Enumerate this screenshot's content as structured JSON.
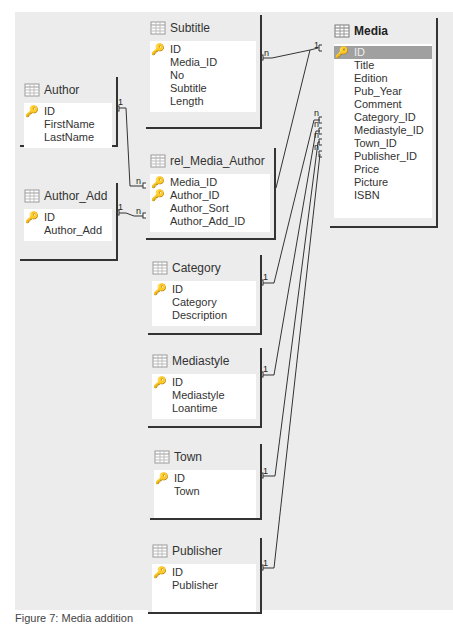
{
  "tables": [
    {
      "id": "subtitle",
      "name": "Subtitle",
      "fields": [
        {
          "name": "ID",
          "key": true
        },
        {
          "name": "Media_ID"
        },
        {
          "name": "No"
        },
        {
          "name": "Subtitle"
        },
        {
          "name": "Length"
        }
      ]
    },
    {
      "id": "author",
      "name": "Author",
      "fields": [
        {
          "name": "ID",
          "key": true
        },
        {
          "name": "FirstName"
        },
        {
          "name": "LastName"
        }
      ]
    },
    {
      "id": "rel_media_author",
      "name": "rel_Media_Author",
      "fields": [
        {
          "name": "Media_ID",
          "key": true
        },
        {
          "name": "Author_ID",
          "key": true
        },
        {
          "name": "Author_Sort"
        },
        {
          "name": "Author_Add_ID"
        }
      ]
    },
    {
      "id": "author_add",
      "name": "Author_Add",
      "fields": [
        {
          "name": "ID",
          "key": true
        },
        {
          "name": "Author_Add"
        }
      ]
    },
    {
      "id": "category",
      "name": "Category",
      "fields": [
        {
          "name": "ID",
          "key": true
        },
        {
          "name": "Category"
        },
        {
          "name": "Description"
        }
      ]
    },
    {
      "id": "mediastyle",
      "name": "Mediastyle",
      "fields": [
        {
          "name": "ID",
          "key": true
        },
        {
          "name": "Mediastyle"
        },
        {
          "name": "Loantime"
        }
      ]
    },
    {
      "id": "town",
      "name": "Town",
      "fields": [
        {
          "name": "ID",
          "key": true
        },
        {
          "name": "Town"
        }
      ]
    },
    {
      "id": "publisher",
      "name": "Publisher",
      "fields": [
        {
          "name": "ID",
          "key": true
        },
        {
          "name": "Publisher"
        }
      ]
    },
    {
      "id": "media",
      "name": "Media",
      "fields": [
        {
          "name": "ID",
          "key": true,
          "selected": true
        },
        {
          "name": "Title"
        },
        {
          "name": "Edition"
        },
        {
          "name": "Pub_Year"
        },
        {
          "name": "Comment"
        },
        {
          "name": "Category_ID"
        },
        {
          "name": "Mediastyle_ID"
        },
        {
          "name": "Town_ID"
        },
        {
          "name": "Publisher_ID"
        },
        {
          "name": "Price"
        },
        {
          "name": "Picture"
        },
        {
          "name": "ISBN"
        }
      ]
    }
  ],
  "relations": [
    {
      "from": "Media.ID",
      "to": "Subtitle.Media_ID",
      "from_card": "1",
      "to_card": "n"
    },
    {
      "from": "Author.ID",
      "to": "rel_Media_Author.Author_ID",
      "from_card": "1",
      "to_card": "n"
    },
    {
      "from": "Author_Add.ID",
      "to": "rel_Media_Author.Author_Add_ID",
      "from_card": "1",
      "to_card": "n"
    },
    {
      "from": "Media.ID",
      "to": "rel_Media_Author.Media_ID",
      "from_card": "1",
      "to_card": "n"
    },
    {
      "from": "Category.ID",
      "to": "Media.Category_ID",
      "from_card": "1",
      "to_card": "n"
    },
    {
      "from": "Mediastyle.ID",
      "to": "Media.Mediastyle_ID",
      "from_card": "1",
      "to_card": "n"
    },
    {
      "from": "Town.ID",
      "to": "Media.Town_ID",
      "from_card": "1",
      "to_card": "n"
    },
    {
      "from": "Publisher.ID",
      "to": "Media.Publisher_ID",
      "from_card": "1",
      "to_card": "n"
    }
  ],
  "caption": "Figure 7: Media addition"
}
